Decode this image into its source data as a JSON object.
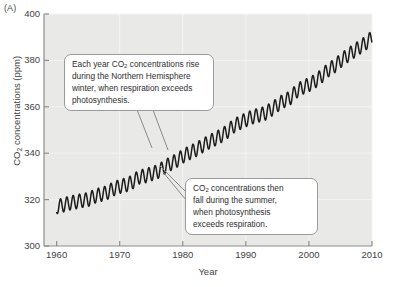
{
  "figure": {
    "panel_label": "(A)",
    "background_color": "#e9e9e7",
    "curve_color": "#1c1c1c",
    "gridline_color": "#f4f4f2",
    "axis_color": "#8d8d8d"
  },
  "annotations": [
    {
      "id": "callout-1",
      "lines": [
        "Each year CO2 concentrations rise",
        "during the Northern Hemisphere",
        "winter, when respiration exceeds",
        "photosynthesis."
      ],
      "text": "Each year CO2 concentrations rise during the Northern Hemisphere winter, when respiration exceeds photosynthesis."
    },
    {
      "id": "callout-2",
      "lines": [
        "CO2 concentrations then",
        "fall during the summer,",
        "when photosynthesis",
        "exceeds respiration."
      ],
      "text": "CO2 concentrations then fall during the summer, when photosynthesis exceeds respiration."
    }
  ],
  "chart_data": {
    "type": "line",
    "title": "",
    "xlabel": "Year",
    "ylabel": "CO2 concentrations (ppm)",
    "xlim": [
      1958,
      2010
    ],
    "ylim": [
      300,
      400
    ],
    "xticks": [
      1960,
      1970,
      1980,
      1990,
      2000,
      2010
    ],
    "yticks": [
      300,
      320,
      340,
      360,
      380,
      400
    ],
    "grid": true,
    "legend": "none",
    "series": [
      {
        "name": "Atmospheric CO2 (Mauna Loa, monthly)",
        "description": "Keeling curve: rising annual trend with seasonal sawtooth oscillation of about 6 ppm peak-to-trough",
        "annual_mean": {
          "x": [
            1960,
            1961,
            1962,
            1963,
            1964,
            1965,
            1966,
            1967,
            1968,
            1969,
            1970,
            1971,
            1972,
            1973,
            1974,
            1975,
            1976,
            1977,
            1978,
            1979,
            1980,
            1981,
            1982,
            1983,
            1984,
            1985,
            1986,
            1987,
            1988,
            1989,
            1990,
            1991,
            1992,
            1993,
            1994,
            1995,
            1996,
            1997,
            1998,
            1999,
            2000,
            2001,
            2002,
            2003,
            2004,
            2005,
            2006,
            2007,
            2008,
            2009,
            2010
          ],
          "y": [
            316.9,
            317.6,
            318.5,
            319.0,
            319.6,
            320.0,
            321.4,
            322.2,
            323.0,
            324.6,
            325.7,
            326.3,
            327.5,
            329.7,
            330.2,
            331.1,
            332.0,
            333.8,
            335.4,
            336.8,
            338.7,
            340.1,
            341.4,
            343.0,
            344.6,
            346.0,
            347.4,
            349.2,
            351.6,
            353.1,
            354.4,
            355.6,
            356.4,
            357.1,
            358.8,
            360.8,
            362.6,
            363.7,
            366.7,
            368.4,
            369.5,
            371.1,
            373.2,
            375.8,
            377.5,
            379.8,
            381.9,
            383.8,
            385.6,
            387.4,
            389.9
          ]
        },
        "seasonal_amplitude_ppm": 6.0,
        "cycles_per_year": 1
      }
    ]
  }
}
